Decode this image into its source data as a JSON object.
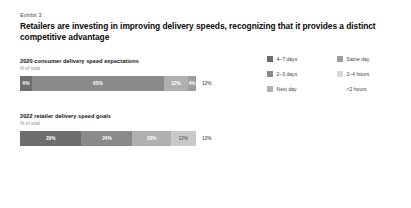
{
  "exhibit": {
    "label": "Exhibit 3",
    "headline": "Retailers are investing in improving delivery speeds, recognizing that it provides a distinct competitive advantage"
  },
  "legend": {
    "items": [
      {
        "label": "4–7 days",
        "color": "#6e6e6e"
      },
      {
        "label": "Same day",
        "color": "#9e9e9e"
      },
      {
        "label": "2–3 days",
        "color": "#8a8a8a"
      },
      {
        "label": "2–4 hours",
        "color": "#d8d8d8"
      },
      {
        "label": "Next day",
        "color": "#b0b0b0"
      },
      {
        "label": "<2 hours",
        "color": "#ffffff"
      }
    ]
  },
  "chart_data": [
    {
      "type": "bar",
      "title": "2020 consumer delivery speed expectations",
      "subtitle": "% of total",
      "orientation": "horizontal-stacked",
      "categories": [
        "4–7 days",
        "2–3 days",
        "Next day",
        "Same day",
        "2–4 hours"
      ],
      "values": [
        6,
        65,
        12,
        4,
        12
      ],
      "labels": [
        "6%",
        "65%",
        "12%",
        "4%",
        "12%"
      ],
      "colors": [
        "#6e6e6e",
        "#8a8a8a",
        "#b0b0b0",
        "#9e9e9e",
        "#d8d8d8"
      ],
      "label_outside": [
        false,
        false,
        false,
        false,
        true
      ],
      "xlabel": "",
      "ylabel": "",
      "xlim": [
        0,
        100
      ],
      "grid": false
    },
    {
      "type": "bar",
      "title": "2022 retailer delivery speed goals",
      "subtitle": "% of total",
      "orientation": "horizontal-stacked",
      "categories": [
        "4–7 days",
        "2–3 days",
        "Next day",
        "Same day",
        "2–4 hours"
      ],
      "values": [
        29,
        24,
        18,
        12,
        12
      ],
      "labels": [
        "29%",
        "24%",
        "18%",
        "12%",
        "12%"
      ],
      "colors": [
        "#6e6e6e",
        "#8a8a8a",
        "#b0b0b0",
        "#c9c9c9",
        "#e8e8e8"
      ],
      "label_outside": [
        false,
        false,
        false,
        false,
        true
      ],
      "xlabel": "",
      "ylabel": "",
      "xlim": [
        0,
        100
      ],
      "grid": false
    }
  ]
}
